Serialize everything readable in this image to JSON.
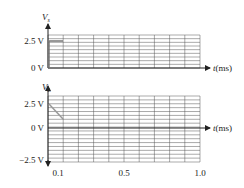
{
  "chart_data": [
    {
      "type": "line",
      "title": "",
      "ylabel": "Vs",
      "xlabel": "t(ms)",
      "yticks": [
        "2.5 V",
        "0 V"
      ],
      "ylim": [
        0,
        3
      ],
      "xlim": [
        0,
        1.0
      ],
      "grid": true,
      "series": [
        {
          "name": "Vs",
          "x": [
            0,
            0.1
          ],
          "y": [
            2.5,
            2.5
          ],
          "color": "#777777"
        }
      ]
    },
    {
      "type": "line",
      "title": "",
      "ylabel": "VL",
      "xlabel": "t(ms)",
      "yticks": [
        "2.5 V",
        "0 V",
        "−2.5 V"
      ],
      "xticks": [
        "0.1",
        "0.5",
        "1.0"
      ],
      "ylim": [
        -2.5,
        3
      ],
      "xlim": [
        0,
        1.0
      ],
      "grid": true,
      "series": [
        {
          "name": "VL",
          "x": [
            0,
            0.1
          ],
          "y": [
            2.5,
            1.0
          ],
          "color": "#999999"
        }
      ]
    }
  ],
  "top": {
    "ylabel_main": "V",
    "ylabel_sub": "s",
    "ytick_high": "2.5 V",
    "ytick_zero": "0 V",
    "xlabel_t": "t",
    "xlabel_unit": "(ms)"
  },
  "bottom": {
    "ylabel_main": "V",
    "ylabel_sub": "L",
    "ytick_high": "2.5 V",
    "ytick_zero": "0 V",
    "ytick_low": "−2.5 V",
    "xlabel_t": "t",
    "xlabel_unit": "(ms)",
    "xtick_1": "0.1",
    "xtick_2": "0.5",
    "xtick_3": "1.0"
  }
}
